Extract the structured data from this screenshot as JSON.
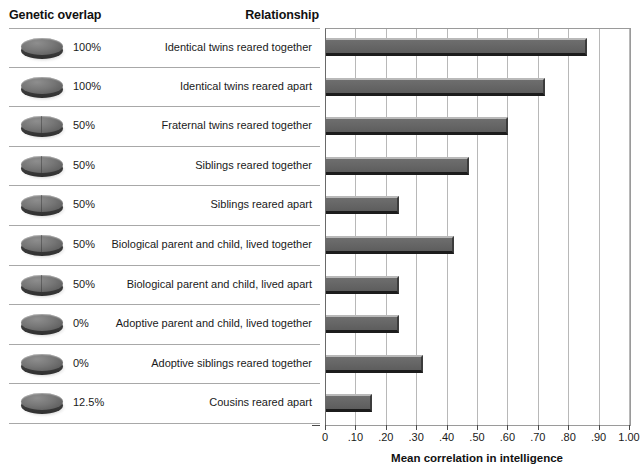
{
  "headers": {
    "genetic_overlap": "Genetic overlap",
    "relationship": "Relationship"
  },
  "chart_data": {
    "type": "bar",
    "orientation": "horizontal",
    "title": "",
    "xlabel": "Mean correlation in intelligence",
    "ylabel": "",
    "xlim": [
      0,
      1.0
    ],
    "xticks": [
      0,
      0.1,
      0.2,
      0.3,
      0.4,
      0.5,
      0.6,
      0.7,
      0.8,
      0.9,
      1.0
    ],
    "xticklabels": [
      "0",
      ".10",
      ".20",
      ".30",
      ".40",
      ".50",
      ".60",
      ".70",
      ".80",
      ".90",
      "1.00"
    ],
    "grid": true,
    "legend": "none",
    "categories": [
      "Identical twins reared together",
      "Identical twins reared apart",
      "Fraternal twins reared together",
      "Siblings reared together",
      "Siblings reared apart",
      "Biological parent and child, lived together",
      "Biological parent and child, lived apart",
      "Adoptive parent and child, lived together",
      "Adoptive siblings reared together",
      "Cousins reared apart"
    ],
    "values": [
      0.86,
      0.72,
      0.6,
      0.47,
      0.24,
      0.42,
      0.24,
      0.24,
      0.32,
      0.15
    ],
    "genetic_overlap": [
      "100%",
      "100%",
      "50%",
      "50%",
      "50%",
      "50%",
      "50%",
      "0%",
      "0%",
      "12.5%"
    ],
    "genetic_overlap_fraction": [
      1.0,
      1.0,
      0.5,
      0.5,
      0.5,
      0.5,
      0.5,
      0.0,
      0.0,
      0.125
    ],
    "bar_color": "#656565",
    "bar_highlight_color": "#b9b9b9",
    "bar_shadow_color": "#1c1c1c",
    "grid_color": "#b8b8b8",
    "rule_color": "#a8a8a8",
    "icon_name": "genetic-overlap-coin-icon"
  }
}
